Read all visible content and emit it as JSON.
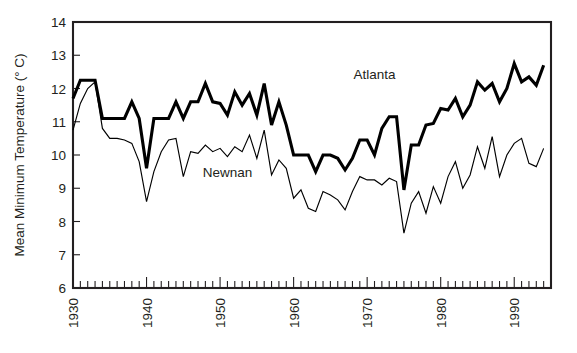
{
  "chart_data": {
    "type": "line",
    "title": "",
    "xlabel": "",
    "ylabel": "Mean Minimum Temperature (° C)",
    "xlim": [
      1930,
      1995
    ],
    "ylim": [
      6,
      14
    ],
    "grid": false,
    "legend": "inline-annotations",
    "y_ticks": [
      6,
      7,
      8,
      9,
      10,
      11,
      12,
      13,
      14
    ],
    "y_tick_labels": [
      "6",
      "7",
      "8",
      "9",
      "10",
      "11",
      "12",
      "13",
      "14"
    ],
    "x_ticks": [
      1930,
      1940,
      1950,
      1960,
      1970,
      1980,
      1990
    ],
    "x_tick_labels": [
      "1930",
      "1940",
      "1950",
      "1960",
      "1970",
      "1980",
      "1990"
    ],
    "x_minor_tick_interval": 1,
    "x": [
      1930,
      1931,
      1932,
      1933,
      1934,
      1935,
      1936,
      1937,
      1938,
      1939,
      1940,
      1941,
      1942,
      1943,
      1944,
      1945,
      1946,
      1947,
      1948,
      1949,
      1950,
      1951,
      1952,
      1953,
      1954,
      1955,
      1956,
      1957,
      1958,
      1959,
      1960,
      1961,
      1962,
      1963,
      1964,
      1965,
      1966,
      1967,
      1968,
      1969,
      1970,
      1971,
      1972,
      1973,
      1974,
      1975,
      1976,
      1977,
      1978,
      1979,
      1980,
      1981,
      1982,
      1983,
      1984,
      1985,
      1986,
      1987,
      1988,
      1989,
      1990,
      1991,
      1992,
      1993,
      1994
    ],
    "series": [
      {
        "name": "Atlanta",
        "style": "thick",
        "stroke_width": 3.1,
        "color": "#000000",
        "label_x": 1971,
        "label_y": 12.3,
        "values": [
          11.7,
          12.25,
          12.25,
          12.25,
          11.1,
          11.1,
          11.1,
          11.1,
          11.6,
          11.1,
          9.6,
          11.1,
          11.1,
          11.1,
          11.6,
          11.1,
          11.6,
          11.6,
          12.15,
          11.6,
          11.55,
          11.2,
          11.9,
          11.5,
          11.85,
          11.2,
          12.15,
          10.9,
          11.6,
          10.9,
          10.0,
          10.0,
          10.0,
          9.5,
          10.0,
          10.0,
          9.9,
          9.55,
          9.9,
          10.45,
          10.45,
          10.0,
          10.8,
          11.15,
          11.15,
          8.95,
          10.3,
          10.3,
          10.9,
          10.95,
          11.4,
          11.35,
          11.7,
          11.15,
          11.5,
          12.2,
          11.95,
          12.15,
          11.6,
          12.0,
          12.75,
          12.2,
          12.35,
          12.1,
          12.7
        ]
      },
      {
        "name": "Newnan",
        "style": "thin",
        "stroke_width": 1.15,
        "color": "#000000",
        "label_x": 1951,
        "label_y": 9.35,
        "values": [
          10.75,
          11.55,
          12.0,
          12.2,
          10.8,
          10.5,
          10.5,
          10.45,
          10.35,
          9.8,
          8.6,
          9.5,
          10.1,
          10.45,
          10.5,
          9.35,
          10.1,
          10.05,
          10.3,
          10.1,
          10.2,
          9.95,
          10.25,
          10.1,
          10.6,
          9.9,
          10.75,
          9.4,
          9.85,
          9.6,
          8.7,
          8.95,
          8.4,
          8.3,
          8.9,
          8.8,
          8.65,
          8.35,
          8.9,
          9.35,
          9.25,
          9.25,
          9.1,
          9.3,
          9.2,
          7.65,
          8.55,
          8.9,
          8.25,
          9.05,
          8.55,
          9.35,
          9.8,
          9.0,
          9.4,
          10.25,
          9.6,
          10.55,
          9.35,
          10.0,
          10.35,
          10.5,
          9.75,
          9.65,
          10.2
        ]
      }
    ]
  },
  "annotations": {
    "atlanta_label": "Atlanta",
    "newnan_label": "Newnan"
  }
}
